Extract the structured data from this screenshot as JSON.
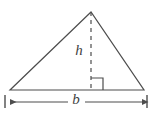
{
  "figure": {
    "kind": "geometry-diagram",
    "width": 152,
    "height": 123,
    "background_color": "#ffffff",
    "stroke_color": "#4d4d4d",
    "label_color": "#3f3f3f"
  },
  "labels": {
    "height_label": "h",
    "base_label": "b"
  },
  "geometry": {
    "triangle": {
      "apex": {
        "x": 91,
        "y": 12
      },
      "left_vertex": {
        "x": 10,
        "y": 90
      },
      "right_vertex": {
        "x": 144,
        "y": 90
      },
      "points": "91,12 10,90 144,90"
    },
    "altitude": {
      "from": {
        "x": 91,
        "y": 12
      },
      "to": {
        "x": 91,
        "y": 90
      },
      "style": "dashed",
      "dash_pattern": "4 4"
    },
    "right_angle_marker": {
      "corner": {
        "x": 91,
        "y": 90
      },
      "size": 12,
      "opens": "right",
      "path": "M 91 78 L 103 78 L 103 90"
    },
    "dimension_line": {
      "y": 102,
      "from_x": 10,
      "to_x": 146,
      "gap_start_x": 68,
      "gap_end_x": 85,
      "left_tick_x": 5,
      "right_tick_x": 147,
      "tick_top_y": 95,
      "tick_bottom_y": 108,
      "arrowheads": "both"
    },
    "label_positions": {
      "h": {
        "x": 79,
        "y": 52
      },
      "b": {
        "x": 76,
        "y": 101
      }
    }
  }
}
